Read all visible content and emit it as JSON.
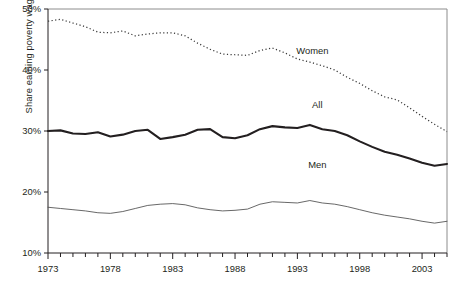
{
  "chart_data": {
    "type": "line",
    "title": "",
    "subtitle": "",
    "xlabel": "",
    "ylabel": "Share earning poverty wage",
    "ylim": [
      10,
      50
    ],
    "ytick_labels": [
      "50%",
      "40%",
      "30%",
      "20%",
      "10%"
    ],
    "ytick_values": [
      50,
      40,
      30,
      20,
      10
    ],
    "xlim": [
      1973,
      2005
    ],
    "xtick_labels": [
      "1973",
      "1978",
      "1983",
      "1988",
      "1993",
      "1998",
      "2003"
    ],
    "xtick_values": [
      1973,
      1978,
      1983,
      1988,
      1993,
      1998,
      2003
    ],
    "minor_xticks": "every year from 1973 to 2005",
    "grid": false,
    "legend_position": "inline-annotations",
    "x": [
      1973,
      1974,
      1975,
      1976,
      1977,
      1978,
      1979,
      1980,
      1981,
      1982,
      1983,
      1984,
      1985,
      1986,
      1987,
      1988,
      1989,
      1990,
      1991,
      1992,
      1993,
      1994,
      1995,
      1996,
      1997,
      1998,
      1999,
      2000,
      2001,
      2002,
      2003,
      2004,
      2005
    ],
    "series": [
      {
        "name": "Women",
        "style": "dotted",
        "label": "Women",
        "label_x": 1994.2,
        "label_y": 42.6,
        "values": [
          48.0,
          48.3,
          47.7,
          47.1,
          46.2,
          46.1,
          46.4,
          45.6,
          45.9,
          46.1,
          46.1,
          45.6,
          44.4,
          43.4,
          42.6,
          42.5,
          42.4,
          43.2,
          43.6,
          42.8,
          41.8,
          41.3,
          40.7,
          40.0,
          38.8,
          37.8,
          36.6,
          35.6,
          35.1,
          33.8,
          32.4,
          31.1,
          29.9
        ]
      },
      {
        "name": "All",
        "style": "thick-solid",
        "label": "All",
        "label_x": 1994.6,
        "label_y": 33.8,
        "values": [
          30.0,
          30.1,
          29.6,
          29.5,
          29.8,
          29.1,
          29.4,
          30.0,
          30.2,
          28.7,
          29.0,
          29.4,
          30.2,
          30.3,
          29.0,
          28.8,
          29.3,
          30.3,
          30.8,
          30.6,
          30.5,
          31.0,
          30.3,
          30.0,
          29.3,
          28.3,
          27.4,
          26.6,
          26.1,
          25.5,
          24.8,
          24.3,
          24.6
        ]
      },
      {
        "name": "Men",
        "style": "thin-solid",
        "label": "Men",
        "label_x": 1994.6,
        "label_y": 24.0,
        "values": [
          17.5,
          17.3,
          17.1,
          16.9,
          16.6,
          16.5,
          16.8,
          17.3,
          17.8,
          18.0,
          18.1,
          17.9,
          17.4,
          17.1,
          16.9,
          17.0,
          17.2,
          18.0,
          18.4,
          18.3,
          18.2,
          18.6,
          18.2,
          18.0,
          17.6,
          17.1,
          16.6,
          16.2,
          15.9,
          15.6,
          15.2,
          14.9,
          15.2
        ]
      }
    ]
  }
}
